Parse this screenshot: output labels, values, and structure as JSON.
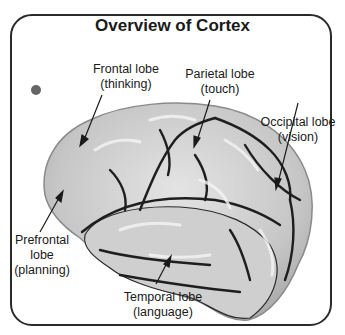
{
  "title": "Overview of Cortex",
  "labels": {
    "frontal": {
      "name": "Frontal lobe",
      "function": "(thinking)"
    },
    "parietal": {
      "name": "Parietal lobe",
      "function": "(touch)"
    },
    "occipital": {
      "name": "Occipital lobe",
      "function": "(vision)"
    },
    "prefrontal": {
      "name1": "Prefrontal",
      "name2": "lobe",
      "function": "(planning)"
    },
    "temporal": {
      "name": "Temporal lobe",
      "function": "(language)"
    }
  },
  "colors": {
    "brain_fill": "#c9c9c9",
    "brain_highlight": "#e6e6e6",
    "sulci": "#1e1e1e",
    "frame": "#2a2a2a"
  }
}
